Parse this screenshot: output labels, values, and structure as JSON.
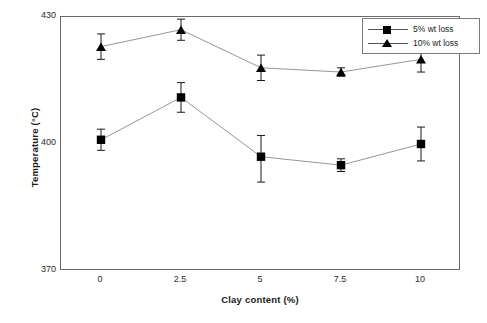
{
  "chart_data": {
    "type": "line",
    "title": "",
    "xlabel": "Clay content (%)",
    "ylabel": "Temperature (°C)",
    "categories": [
      "0",
      "2.5",
      "5",
      "7.5",
      "10"
    ],
    "x": [
      0,
      2.5,
      5,
      7.5,
      10
    ],
    "xlim": [
      -1.25,
      11.25
    ],
    "ylim": [
      370,
      430
    ],
    "yticks": [
      "370",
      "400",
      "430"
    ],
    "ytick_values": [
      370,
      400,
      430
    ],
    "xticks": [
      "0",
      "2.5",
      "5",
      "7.5",
      "10"
    ],
    "grid": false,
    "legend_position": "top-right",
    "series": [
      {
        "name": "5% wt loss",
        "marker": "square",
        "color": "#000000",
        "values": [
          401,
          411,
          397,
          395,
          400
        ],
        "errors_low": [
          2.5,
          3.5,
          6,
          1.5,
          4
        ],
        "errors_high": [
          2.5,
          3.5,
          5,
          1.5,
          4
        ]
      },
      {
        "name": "10% wt loss",
        "marker": "triangle",
        "color": "#000000",
        "values": [
          423,
          427,
          418,
          417,
          420
        ],
        "errors_low": [
          3,
          2.5,
          3,
          1,
          3
        ],
        "errors_high": [
          3,
          2.5,
          3,
          1,
          3
        ]
      }
    ]
  },
  "legend": {
    "items": [
      {
        "label": "5% wt loss",
        "marker": "square"
      },
      {
        "label": "10% wt loss",
        "marker": "triangle"
      }
    ]
  },
  "axes": {
    "y_title": "Temperature (°C)",
    "x_title": "Clay content (%)"
  }
}
